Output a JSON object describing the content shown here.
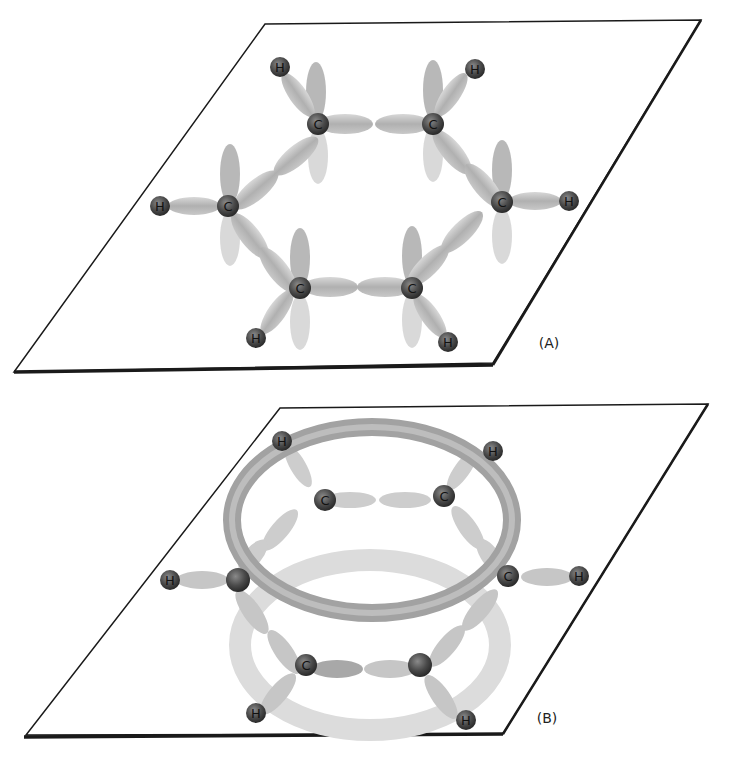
{
  "figure": {
    "panels": [
      {
        "id": "A",
        "label": "(A)",
        "description": "Planar hexagonal ring of six carbon atoms (C) each bonded to one hydrogen (H) via sigma orbitals; unhybridized p orbitals shown perpendicular to the plane",
        "atoms": {
          "carbon_label": "C",
          "hydrogen_label": "H",
          "carbon_count": 6,
          "hydrogen_count": 6
        }
      },
      {
        "id": "B",
        "label": "(B)",
        "description": "Same ring with delocalized pi electron clouds shown as two doughnut-shaped rings above and below the molecular plane",
        "atoms": {
          "carbon_label": "C",
          "hydrogen_label": "H",
          "carbon_count": 6,
          "hydrogen_count": 6
        }
      }
    ],
    "colors": {
      "plane_edge": "#1a1a1a",
      "atom_fill": "#4a4a4a",
      "bond_orbital": "#b9b9b9",
      "p_orbital": "#a8a8a8",
      "pi_ring_top": "#9c9c9c",
      "pi_ring_bottom": "#dadada"
    }
  }
}
